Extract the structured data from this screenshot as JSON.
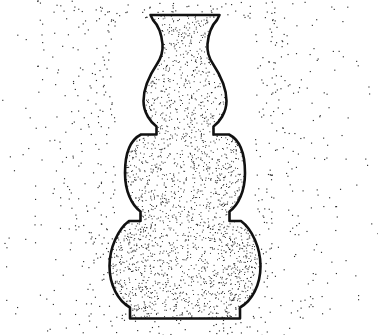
{
  "artwork": {
    "title": "Stippled Gourd Vase",
    "subject": "vase",
    "medium": "pen-and-ink stipple drawing",
    "background_color": "#ffffff",
    "ink_color": "#111111",
    "stipple_color": "#1a1a1a",
    "canvas": {
      "width": 378,
      "height": 335
    },
    "visible_text": []
  },
  "vase": {
    "name": "triple-gourd vase",
    "center_x": 185,
    "outline_stroke_width": 2.6,
    "parts": [
      {
        "name": "rim",
        "label": "flared lip",
        "top_y": 14,
        "left_x": 150,
        "right_x": 220
      },
      {
        "name": "neck",
        "label": "waisted neck",
        "top_y": 18,
        "bottom_y": 58,
        "narrowest_width": 50
      },
      {
        "name": "upper-bulb",
        "label": "upper gourd",
        "top_y": 58,
        "bottom_y": 122,
        "left_x": 143,
        "right_x": 227
      },
      {
        "name": "upper-waist",
        "label": "stepped collar",
        "y": 122,
        "left_x": 155,
        "right_x": 215
      },
      {
        "name": "middle-bulb",
        "label": "middle gourd",
        "top_y": 136,
        "bottom_y": 212,
        "left_x": 126,
        "right_x": 244
      },
      {
        "name": "lower-waist",
        "label": "stepped collar",
        "y": 212,
        "left_x": 141,
        "right_x": 229
      },
      {
        "name": "lower-bulb",
        "label": "lower gourd",
        "top_y": 222,
        "bottom_y": 306,
        "left_x": 110,
        "right_x": 260
      },
      {
        "name": "foot",
        "label": "splayed foot",
        "top_y": 306,
        "bottom_y": 319,
        "left_x": 128,
        "right_x": 242
      }
    ],
    "outline_path": "M150.5,15 L219.5,15 L217,20 C211,26 208.5,34 207.5,44 C206.8,52 209,58 213,64 C221,76 226.5,90 226.5,101 C226.5,113 219,122.5 213.5,126.5 L213.5,134.5 L229,134.5 C238,139 245,150 245,173 C245,191 238.5,205 229.5,211.5 L229.5,221 L241,221 C252,229 260.5,248 260.5,266 C260.5,285 252,301 240,307.5 L240,318.5 L130,318.5 L130,307.5 C118,301 109.5,285 109.5,266 C109.5,248 118,229 129,221 L140.5,221 L140.5,211.5 C131.5,205 125,191 125,173 C125,150 132,139 141,134.5 L156.5,134.5 L156.5,126.5 C151,122.5 143.5,113 143.5,101 C143.5,90 149,76 157,64 C161,58 163.2,52 162.5,44 C161.5,34 159,26 153,20 Z",
    "stipple": {
      "interior_dot_count": 5200,
      "interior_dot_size": 0.95,
      "background_dot_count": 620,
      "background_dot_size": 1.15,
      "background_falloff": "dense near silhouette, sparse at edges"
    }
  }
}
